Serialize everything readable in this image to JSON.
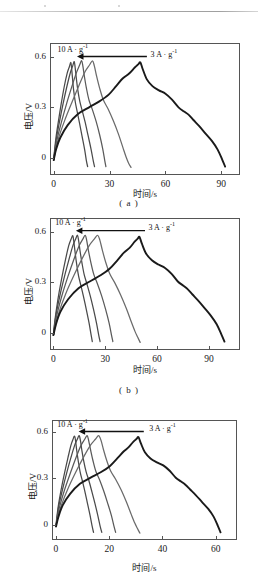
{
  "figure": {
    "kind": "galvanostatic-charge-discharge-figure",
    "panel_count": 3
  },
  "chart_data": [
    {
      "type": "line",
      "panel": "a",
      "caption": "( a )",
      "title": "",
      "xlabel": "时间/s",
      "ylabel": "电压/V",
      "xlim": [
        -2,
        100
      ],
      "ylim": [
        -0.1,
        0.68
      ],
      "xticks": [
        0,
        30,
        60,
        90
      ],
      "yticks": [
        0,
        0.3,
        0.6
      ],
      "xtick_labels": [
        "0",
        "30",
        "60",
        "90"
      ],
      "ytick_labels": [
        "0",
        "0.3",
        "0.6"
      ],
      "grid": false,
      "legend": "none",
      "annotations": [
        {
          "name": "high-rate-label",
          "text": "10 A · g",
          "sup": "-1",
          "x": 2,
          "y": 0.645
        },
        {
          "name": "low-rate-label",
          "text": "3 A · g",
          "sup": "-1",
          "x": 52,
          "y": 0.615
        },
        {
          "name": "rate-arrow",
          "from_x": 50,
          "to_x": 12.5,
          "y": 0.6,
          "direction": "left"
        }
      ],
      "series": [
        {
          "name": "10 A·g-1",
          "color": "#4a4a4a",
          "x": [
            0,
            0.4,
            1.2,
            2.4,
            4.0,
            5.6,
            7.2,
            8.4,
            9.2,
            9.6,
            10.1,
            10.7,
            11.6,
            12.6,
            13.8,
            15.2,
            16.6,
            17.6,
            18.2
          ],
          "y": [
            -0.01,
            0.04,
            0.12,
            0.21,
            0.32,
            0.42,
            0.5,
            0.54,
            0.565,
            0.53,
            0.47,
            0.4,
            0.33,
            0.275,
            0.21,
            0.13,
            0.05,
            -0.02,
            -0.05
          ]
        },
        {
          "name": "8 A·g-1",
          "color": "#4a4a4a",
          "x": [
            0,
            0.5,
            1.5,
            3.0,
            5.0,
            7.0,
            8.8,
            10.2,
            11.0,
            11.5,
            12.1,
            12.9,
            14.0,
            15.3,
            16.8,
            18.4,
            20.0,
            21.2,
            21.9
          ],
          "y": [
            -0.01,
            0.04,
            0.12,
            0.21,
            0.32,
            0.42,
            0.5,
            0.545,
            0.57,
            0.535,
            0.475,
            0.405,
            0.335,
            0.28,
            0.215,
            0.135,
            0.055,
            -0.015,
            -0.05
          ]
        },
        {
          "name": "6 A·g-1",
          "color": "#5a5a5a",
          "x": [
            0,
            0.7,
            2.0,
            4.2,
            7.0,
            9.8,
            12.2,
            13.9,
            15.0,
            15.7,
            16.5,
            17.6,
            19.0,
            20.8,
            22.8,
            24.7,
            26.3,
            27.4,
            28.0
          ],
          "y": [
            -0.012,
            0.04,
            0.12,
            0.215,
            0.325,
            0.425,
            0.505,
            0.55,
            0.575,
            0.54,
            0.48,
            0.41,
            0.34,
            0.285,
            0.215,
            0.135,
            0.055,
            -0.015,
            -0.05
          ]
        },
        {
          "name": "5 A·g-1",
          "color": "#6a6a6a",
          "x": [
            0,
            1.0,
            2.8,
            5.8,
            9.8,
            13.6,
            16.8,
            19.2,
            20.8,
            21.8,
            23.0,
            24.6,
            26.6,
            29.2,
            32.0,
            34.8,
            37.2,
            38.9,
            40.2,
            41.5
          ],
          "y": [
            -0.012,
            0.045,
            0.125,
            0.22,
            0.33,
            0.43,
            0.51,
            0.55,
            0.575,
            0.545,
            0.485,
            0.415,
            0.345,
            0.29,
            0.22,
            0.14,
            0.06,
            0.005,
            -0.03,
            -0.055
          ]
        },
        {
          "name": "3 A·g-1",
          "color": "#1a1a1a",
          "x": [
            0,
            1.2,
            3.5,
            7.5,
            13.0,
            19.0,
            24.5,
            29.5,
            33.5,
            37.0,
            40.5,
            43.5,
            45.5,
            46.5,
            47.8,
            50.0,
            53.0,
            56.5,
            60.0,
            63.5,
            67.0,
            70.0,
            72.5,
            75.0,
            78.0,
            81.5,
            85.0,
            88.0,
            90.5,
            92.0
          ],
          "y": [
            -0.012,
            0.05,
            0.12,
            0.195,
            0.26,
            0.3,
            0.335,
            0.375,
            0.425,
            0.47,
            0.5,
            0.535,
            0.555,
            0.565,
            0.525,
            0.465,
            0.425,
            0.4,
            0.38,
            0.345,
            0.3,
            0.275,
            0.255,
            0.225,
            0.19,
            0.145,
            0.1,
            0.05,
            -0.01,
            -0.05
          ]
        }
      ]
    },
    {
      "type": "line",
      "panel": "b",
      "caption": "( b )",
      "title": "",
      "xlabel": "时间/s",
      "ylabel": "电压/V",
      "xlim": [
        -2,
        108
      ],
      "ylim": [
        -0.1,
        0.68
      ],
      "xticks": [
        0,
        30,
        60,
        90
      ],
      "yticks": [
        0,
        0.3,
        0.6
      ],
      "xtick_labels": [
        "0",
        "30",
        "60",
        "90"
      ],
      "ytick_labels": [
        "0",
        "0.3",
        "0.6"
      ],
      "grid": false,
      "legend": "none",
      "annotations": [
        {
          "name": "high-rate-label",
          "text": "10 A · g",
          "sup": "-1",
          "x": 1,
          "y": 0.655
        },
        {
          "name": "low-rate-label",
          "text": "3 A · g",
          "sup": "-1",
          "x": 55,
          "y": 0.625
        },
        {
          "name": "rate-arrow",
          "from_x": 53,
          "to_x": 13,
          "y": 0.605,
          "direction": "left"
        }
      ],
      "series": [
        {
          "name": "10 A·g-1",
          "color": "#4a4a4a",
          "x": [
            0,
            0.5,
            1.5,
            3.0,
            5.0,
            7.0,
            8.8,
            10.2,
            11.2,
            11.8,
            12.5,
            13.4,
            14.5,
            15.8,
            17.3,
            19.0,
            20.6,
            21.8,
            22.5
          ],
          "y": [
            -0.012,
            0.045,
            0.125,
            0.225,
            0.335,
            0.435,
            0.515,
            0.555,
            0.575,
            0.54,
            0.48,
            0.41,
            0.34,
            0.285,
            0.22,
            0.14,
            0.06,
            -0.01,
            -0.05
          ]
        },
        {
          "name": "8 A·g-1",
          "color": "#4a4a4a",
          "x": [
            0,
            0.6,
            1.8,
            3.8,
            6.4,
            9.0,
            11.2,
            12.8,
            13.9,
            14.6,
            15.4,
            16.5,
            17.8,
            19.4,
            21.3,
            23.2,
            24.9,
            26.2,
            27.0
          ],
          "y": [
            -0.012,
            0.045,
            0.125,
            0.225,
            0.335,
            0.435,
            0.515,
            0.555,
            0.578,
            0.545,
            0.485,
            0.415,
            0.345,
            0.29,
            0.22,
            0.14,
            0.06,
            -0.012,
            -0.05
          ]
        },
        {
          "name": "6 A·g-1",
          "color": "#5a5a5a",
          "x": [
            0,
            0.8,
            2.4,
            5.0,
            8.4,
            11.8,
            14.8,
            17.0,
            18.4,
            19.3,
            20.3,
            21.7,
            23.4,
            25.5,
            27.9,
            30.2,
            32.2,
            33.6,
            34.4
          ],
          "y": [
            -0.012,
            0.045,
            0.125,
            0.225,
            0.335,
            0.435,
            0.515,
            0.555,
            0.578,
            0.545,
            0.485,
            0.415,
            0.345,
            0.29,
            0.22,
            0.14,
            0.06,
            -0.012,
            -0.05
          ]
        },
        {
          "name": "5 A·g-1",
          "color": "#6a6a6a",
          "x": [
            0,
            1.2,
            3.4,
            7.0,
            11.8,
            16.6,
            20.6,
            23.6,
            25.6,
            26.9,
            28.3,
            30.2,
            32.6,
            35.6,
            38.9,
            42.2,
            45.1,
            47.2,
            48.8,
            50.2
          ],
          "y": [
            -0.012,
            0.05,
            0.13,
            0.23,
            0.34,
            0.44,
            0.515,
            0.555,
            0.578,
            0.548,
            0.49,
            0.42,
            0.35,
            0.295,
            0.225,
            0.145,
            0.065,
            0.01,
            -0.025,
            -0.055
          ]
        },
        {
          "name": "3 A·g-1",
          "color": "#1a1a1a",
          "x": [
            0,
            1.4,
            4.0,
            8.5,
            14.5,
            21.0,
            27.0,
            32.5,
            37.0,
            40.8,
            44.2,
            47.0,
            48.8,
            49.8,
            51.2,
            53.6,
            57.0,
            60.8,
            64.6,
            68.4,
            72.0,
            75.2,
            77.8,
            80.5,
            83.8,
            87.5,
            91.2,
            94.5,
            97.2,
            99.0
          ],
          "y": [
            -0.012,
            0.05,
            0.125,
            0.2,
            0.265,
            0.305,
            0.34,
            0.38,
            0.43,
            0.475,
            0.505,
            0.54,
            0.558,
            0.568,
            0.528,
            0.47,
            0.43,
            0.405,
            0.385,
            0.35,
            0.305,
            0.28,
            0.258,
            0.228,
            0.192,
            0.148,
            0.102,
            0.052,
            -0.008,
            -0.05
          ]
        }
      ]
    },
    {
      "type": "line",
      "panel": "c",
      "caption": "",
      "title": "",
      "xlabel": "时间/s",
      "ylabel": "电压/V",
      "xlim": [
        -1.5,
        68
      ],
      "ylim": [
        -0.1,
        0.68
      ],
      "xticks": [
        0,
        20,
        40,
        60
      ],
      "yticks": [
        0,
        0.3,
        0.6
      ],
      "xtick_labels": [
        "0",
        "20",
        "40",
        "60"
      ],
      "ytick_labels": [
        "0",
        "0.3",
        "0.6"
      ],
      "grid": false,
      "legend": "none",
      "annotations": [
        {
          "name": "high-rate-label",
          "text": "10 A · g",
          "sup": "-1",
          "x": 0.5,
          "y": 0.655
        },
        {
          "name": "low-rate-label",
          "text": "3 A · g",
          "sup": "-1",
          "x": 35,
          "y": 0.625
        },
        {
          "name": "rate-arrow",
          "from_x": 33,
          "to_x": 8.5,
          "y": 0.605,
          "direction": "left"
        }
      ],
      "series": [
        {
          "name": "10 A·g-1",
          "color": "#4a4a4a",
          "x": [
            0,
            0.3,
            0.9,
            1.9,
            3.2,
            4.5,
            5.6,
            6.4,
            7.0,
            7.4,
            7.8,
            8.4,
            9.1,
            9.9,
            10.8,
            11.8,
            12.8,
            13.6,
            14.1
          ],
          "y": [
            -0.012,
            0.045,
            0.125,
            0.225,
            0.335,
            0.435,
            0.515,
            0.555,
            0.575,
            0.54,
            0.48,
            0.41,
            0.34,
            0.285,
            0.22,
            0.14,
            0.06,
            -0.012,
            -0.05
          ]
        },
        {
          "name": "8 A·g-1",
          "color": "#4a4a4a",
          "x": [
            0,
            0.4,
            1.1,
            2.4,
            4.0,
            5.6,
            7.0,
            8.0,
            8.7,
            9.2,
            9.7,
            10.4,
            11.3,
            12.3,
            13.4,
            14.6,
            15.7,
            16.6,
            17.2
          ],
          "y": [
            -0.012,
            0.045,
            0.125,
            0.225,
            0.335,
            0.435,
            0.515,
            0.555,
            0.578,
            0.545,
            0.485,
            0.415,
            0.345,
            0.29,
            0.22,
            0.14,
            0.06,
            -0.012,
            -0.05
          ]
        },
        {
          "name": "6 A·g-1",
          "color": "#5a5a5a",
          "x": [
            0,
            0.5,
            1.5,
            3.2,
            5.4,
            7.5,
            9.4,
            10.8,
            11.7,
            12.3,
            13.0,
            13.9,
            15.0,
            16.4,
            17.9,
            19.4,
            20.8,
            21.8,
            22.4
          ],
          "y": [
            -0.012,
            0.045,
            0.125,
            0.225,
            0.335,
            0.435,
            0.515,
            0.555,
            0.578,
            0.545,
            0.485,
            0.415,
            0.345,
            0.29,
            0.22,
            0.14,
            0.06,
            -0.012,
            -0.05
          ]
        },
        {
          "name": "5 A·g-1",
          "color": "#6a6a6a",
          "x": [
            0,
            0.7,
            2.1,
            4.4,
            7.4,
            10.4,
            12.9,
            14.8,
            16.0,
            16.9,
            17.8,
            19.0,
            20.5,
            22.4,
            24.5,
            26.5,
            28.3,
            29.6,
            30.6,
            31.5
          ],
          "y": [
            -0.012,
            0.05,
            0.13,
            0.23,
            0.34,
            0.44,
            0.515,
            0.555,
            0.578,
            0.548,
            0.49,
            0.42,
            0.35,
            0.295,
            0.225,
            0.145,
            0.065,
            0.01,
            -0.025,
            -0.055
          ]
        },
        {
          "name": "3 A·g-1",
          "color": "#1a1a1a",
          "x": [
            0,
            0.9,
            2.5,
            5.3,
            9.0,
            13.0,
            16.8,
            20.2,
            23.0,
            25.4,
            27.4,
            29.1,
            30.3,
            31.0,
            31.9,
            33.4,
            35.5,
            37.9,
            40.3,
            42.7,
            45.0,
            47.0,
            48.7,
            50.4,
            52.5,
            54.8,
            57.2,
            59.2,
            60.8,
            61.8
          ],
          "y": [
            -0.012,
            0.05,
            0.125,
            0.2,
            0.265,
            0.305,
            0.34,
            0.38,
            0.43,
            0.475,
            0.505,
            0.54,
            0.558,
            0.568,
            0.528,
            0.47,
            0.43,
            0.405,
            0.385,
            0.35,
            0.305,
            0.28,
            0.258,
            0.228,
            0.192,
            0.148,
            0.102,
            0.052,
            -0.008,
            -0.05
          ]
        }
      ]
    }
  ]
}
